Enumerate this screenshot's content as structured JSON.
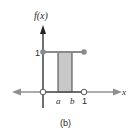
{
  "diagram": {
    "type": "uniform-density-plot",
    "y_axis_label": "f(x)",
    "x_axis_label": "x",
    "y_tick_label": "1",
    "x_tick_labels": [
      "a",
      "b",
      "1"
    ],
    "caption": "(b)",
    "colors": {
      "axis": "#888888",
      "shade": "#c8c8c8",
      "line": "#444444",
      "point": "#8a8a8a"
    }
  }
}
